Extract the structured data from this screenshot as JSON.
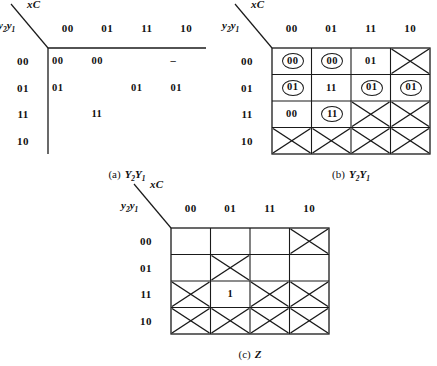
{
  "figure": {
    "row_variable": "y2y1",
    "col_variable": "xC",
    "col_headers": [
      "00",
      "01",
      "11",
      "10"
    ],
    "row_headers": [
      "00",
      "01",
      "11",
      "10"
    ]
  },
  "maps": [
    {
      "id": "a",
      "caption_tag": "(a)",
      "caption_fn": "Y2Y1",
      "gridded": false,
      "col_variable": "xC",
      "row_variable": "y2y1",
      "col_headers": [
        "00",
        "01",
        "11",
        "10"
      ],
      "row_headers": [
        "00",
        "01",
        "11",
        "10"
      ],
      "cells": [
        [
          {
            "text": "00",
            "circled": false,
            "x": false
          },
          {
            "text": "00",
            "circled": false,
            "x": false
          },
          {
            "text": "",
            "circled": false,
            "x": false
          },
          {
            "text": "–",
            "circled": false,
            "x": false
          }
        ],
        [
          {
            "text": "01",
            "circled": false,
            "x": false
          },
          {
            "text": "",
            "circled": false,
            "x": false
          },
          {
            "text": "01",
            "circled": false,
            "x": false
          },
          {
            "text": "01",
            "circled": false,
            "x": false
          }
        ],
        [
          {
            "text": "",
            "circled": false,
            "x": false
          },
          {
            "text": "11",
            "circled": false,
            "x": false
          },
          {
            "text": "",
            "circled": false,
            "x": false
          },
          {
            "text": "",
            "circled": false,
            "x": false
          }
        ],
        [
          {
            "text": "",
            "circled": false,
            "x": false
          },
          {
            "text": "",
            "circled": false,
            "x": false
          },
          {
            "text": "",
            "circled": false,
            "x": false
          },
          {
            "text": "",
            "circled": false,
            "x": false
          }
        ]
      ]
    },
    {
      "id": "b",
      "caption_tag": "(b)",
      "caption_fn": "Y2Y1",
      "gridded": true,
      "col_variable": "xC",
      "row_variable": "y2y1",
      "col_headers": [
        "00",
        "01",
        "11",
        "10"
      ],
      "row_headers": [
        "00",
        "01",
        "11",
        "10"
      ],
      "cells": [
        [
          {
            "text": "00",
            "circled": true,
            "x": false
          },
          {
            "text": "00",
            "circled": true,
            "x": false
          },
          {
            "text": "01",
            "circled": false,
            "x": false
          },
          {
            "text": "",
            "circled": false,
            "x": true
          }
        ],
        [
          {
            "text": "01",
            "circled": true,
            "x": false
          },
          {
            "text": "11",
            "circled": false,
            "x": false
          },
          {
            "text": "01",
            "circled": true,
            "x": false
          },
          {
            "text": "01",
            "circled": true,
            "x": false
          }
        ],
        [
          {
            "text": "00",
            "circled": false,
            "x": false
          },
          {
            "text": "11",
            "circled": true,
            "x": false
          },
          {
            "text": "",
            "circled": false,
            "x": true
          },
          {
            "text": "",
            "circled": false,
            "x": true
          }
        ],
        [
          {
            "text": "",
            "circled": false,
            "x": true
          },
          {
            "text": "",
            "circled": false,
            "x": true
          },
          {
            "text": "",
            "circled": false,
            "x": true
          },
          {
            "text": "",
            "circled": false,
            "x": true
          }
        ]
      ]
    },
    {
      "id": "c",
      "caption_tag": "(c)",
      "caption_fn": "Z",
      "gridded": true,
      "col_variable": "xC",
      "row_variable": "y2y1",
      "col_headers": [
        "00",
        "01",
        "11",
        "10"
      ],
      "row_headers": [
        "00",
        "01",
        "11",
        "10"
      ],
      "cells": [
        [
          {
            "text": "",
            "circled": false,
            "x": false
          },
          {
            "text": "",
            "circled": false,
            "x": false
          },
          {
            "text": "",
            "circled": false,
            "x": false
          },
          {
            "text": "",
            "circled": false,
            "x": true
          }
        ],
        [
          {
            "text": "",
            "circled": false,
            "x": false
          },
          {
            "text": "",
            "circled": false,
            "x": true
          },
          {
            "text": "",
            "circled": false,
            "x": false
          },
          {
            "text": "",
            "circled": false,
            "x": false
          }
        ],
        [
          {
            "text": "",
            "circled": false,
            "x": true
          },
          {
            "text": "1",
            "circled": false,
            "x": false
          },
          {
            "text": "",
            "circled": false,
            "x": true
          },
          {
            "text": "",
            "circled": false,
            "x": true
          }
        ],
        [
          {
            "text": "",
            "circled": false,
            "x": true
          },
          {
            "text": "",
            "circled": false,
            "x": true
          },
          {
            "text": "",
            "circled": false,
            "x": true
          },
          {
            "text": "",
            "circled": false,
            "x": true
          }
        ]
      ]
    }
  ]
}
